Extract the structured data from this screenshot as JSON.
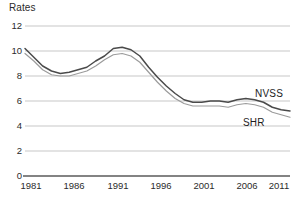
{
  "chart_data": {
    "type": "line",
    "title": "",
    "ylabel": "Rates",
    "xlabel": "",
    "ylim": [
      0,
      12
    ],
    "xlim": [
      1981,
      2011
    ],
    "yticks": [
      0,
      2,
      4,
      6,
      8,
      10,
      12
    ],
    "xticks": [
      1981,
      1986,
      1991,
      1996,
      2001,
      2006,
      2011
    ],
    "grid": true,
    "legend_position": "inline-right",
    "x": [
      1981,
      1982,
      1983,
      1984,
      1985,
      1986,
      1987,
      1988,
      1989,
      1990,
      1991,
      1992,
      1993,
      1994,
      1995,
      1996,
      1997,
      1998,
      1999,
      2000,
      2001,
      2002,
      2003,
      2004,
      2005,
      2006,
      2007,
      2008,
      2009,
      2010,
      2011
    ],
    "series": [
      {
        "name": "NVSS",
        "color": "#4a4a4a",
        "values": [
          10.2,
          9.5,
          8.8,
          8.4,
          8.2,
          8.3,
          8.5,
          8.7,
          9.2,
          9.6,
          10.2,
          10.3,
          10.1,
          9.6,
          8.7,
          7.9,
          7.2,
          6.6,
          6.1,
          5.9,
          5.9,
          6.0,
          6.0,
          5.9,
          6.1,
          6.2,
          6.1,
          5.9,
          5.5,
          5.3,
          5.2
        ]
      },
      {
        "name": "SHR",
        "color": "#9b9b9b",
        "values": [
          9.8,
          9.2,
          8.5,
          8.1,
          8.0,
          8.0,
          8.2,
          8.4,
          8.8,
          9.3,
          9.7,
          9.8,
          9.6,
          9.1,
          8.3,
          7.5,
          6.8,
          6.2,
          5.8,
          5.6,
          5.6,
          5.6,
          5.6,
          5.5,
          5.7,
          5.8,
          5.7,
          5.5,
          5.1,
          4.9,
          4.7
        ]
      }
    ],
    "annotations": [
      {
        "text": "NVSS",
        "x": 2009,
        "y": 6.6
      },
      {
        "text": "SHR",
        "x": 2007,
        "y": 4.5
      }
    ]
  },
  "axis": {
    "y_title": "Rates",
    "y_labels": [
      "12",
      "10",
      "8",
      "6",
      "4",
      "2",
      "0"
    ],
    "x_labels": [
      "1981",
      "1986",
      "1991",
      "1996",
      "2001",
      "2006",
      "2011"
    ]
  },
  "colors": {
    "grid": "#b9b9b9",
    "axis": "#5a5a5a",
    "nvss": "#4a4a4a",
    "shr": "#9b9b9b",
    "text": "#2b2b2b",
    "background": "#ffffff"
  }
}
